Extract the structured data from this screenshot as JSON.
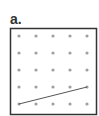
{
  "figure": {
    "label": "a.",
    "grid": {
      "rows": 5,
      "cols": 5
    },
    "dot_color": "#a0a0a0",
    "frame_color": "#333333",
    "line_color": "#555555",
    "segment": {
      "from": {
        "col": 0,
        "row": 4
      },
      "to": {
        "col": 4,
        "row": 3
      }
    }
  }
}
